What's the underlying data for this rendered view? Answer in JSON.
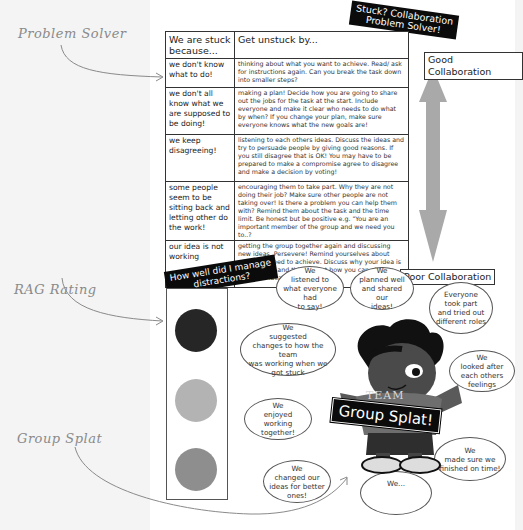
{
  "annotations": {
    "problem_solver": "Problem Solver",
    "rag_rating": "RAG Rating",
    "group_splat": "Group Splat"
  },
  "problem_solver_banner": "Stuck? Collaboration\nProblem Solver!",
  "stuck_table": {
    "headers": [
      "We are stuck because...",
      "Get unstuck by..."
    ],
    "rows": [
      {
        "problem": "we don't know what to do!",
        "solution": "thinking about what you want to achieve. Read/ ask for instructions again. Can you break the task down into smaller steps?"
      },
      {
        "problem": "we don't all know what we are supposed to be doing!",
        "solution": "making a plan! Decide how you are going to share out the jobs for the task at the start. Include everyone and make it clear who needs to do what by when? If you change your plan, make sure everyone knows what the new goals are!"
      },
      {
        "problem": "we keep disagreeing!",
        "solution": "listening to each others ideas. Discuss the ideas and try to persuade people by giving good reasons. If you still disagree that is OK! You may have to be prepared to make a compromise agree to disagree and make a decision by voting!"
      },
      {
        "problem": "some people seem to be sitting back and letting other do the work!",
        "solution": "encouraging them to take part. Why they are not doing their job? Make sure other people are not taking over! Is there a problem you can help them with? Remind them about the task and the time limit. Be honest but be positive e.g. \"You are an important member of the group and we need you to..?"
      },
      {
        "problem": "our idea is not working",
        "solution": "getting the group together again and discussing new ideas. Persevere! Remind yourselves about what you need to achieve. Discuss why your idea is not working and think about how you can change your first idea for a better one."
      }
    ]
  },
  "scale": {
    "top_label": "Good Collaboration",
    "bottom_label": "Poor Collaboration",
    "arrow_color": "#a9a9a9"
  },
  "rag": {
    "banner": "How well did I manage\ndistractions?",
    "lights": [
      {
        "name": "red",
        "color": "#262626"
      },
      {
        "name": "amber",
        "color": "#b3b3b3"
      },
      {
        "name": "green",
        "color": "#8e8e8e"
      }
    ]
  },
  "mascot": {
    "shirt_text": "TEAM",
    "banner": "Group Splat!"
  },
  "bubbles": [
    {
      "text": "We\nlistened to\nwhat everyone had\nto say!"
    },
    {
      "text": "We\nplanned well\nand shared our\nideas!"
    },
    {
      "text": "Everyone\ntook part\nand tried out\ndifferent roles"
    },
    {
      "text": "We\nsuggested\nchanges to how the team\nwas working when we\ngot stuck"
    },
    {
      "text": "We\nlooked after\neach others\nfeelings"
    },
    {
      "text": "We\nenjoyed\nworking together!"
    },
    {
      "text": "We\nmade sure we\nfinished on time!"
    },
    {
      "text": "We\nchanged our\nideas for better\nones!"
    },
    {
      "text": "We..."
    }
  ]
}
